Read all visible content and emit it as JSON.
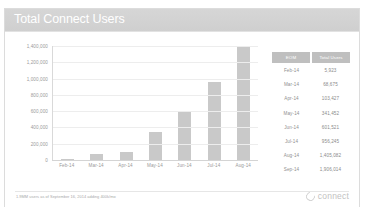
{
  "top_strip": {
    "text": ""
  },
  "card": {
    "title": "Total Connect Users"
  },
  "chart_data": {
    "type": "bar",
    "title": "Total Connect Users",
    "xlabel": "",
    "ylabel": "",
    "ylim": [
      0,
      1400000
    ],
    "grid": true,
    "legend": "none",
    "categories": [
      "Feb-14",
      "Mar-14",
      "Apr-14",
      "May-14",
      "Jun-14",
      "Jul-14",
      "Aug-14"
    ],
    "values": [
      5923,
      68675,
      103427,
      341452,
      601521,
      956245,
      1405082
    ],
    "ytick_labels": [
      "1,400,000",
      "1,200,000",
      "1,000,000",
      "800,000",
      "600,000",
      "400,000",
      "200,000",
      "0"
    ],
    "ytick_values": [
      1400000,
      1200000,
      1000000,
      800000,
      600000,
      400000,
      200000,
      0
    ],
    "bar_color": "#c9c9c9"
  },
  "table": {
    "headers": [
      "EOM",
      "Total Users"
    ],
    "rows": [
      {
        "eom": "Feb-14",
        "users": "5,923"
      },
      {
        "eom": "Mar-14",
        "users": "68,675"
      },
      {
        "eom": "Apr-14",
        "users": "103,427"
      },
      {
        "eom": "May-14",
        "users": "341,452"
      },
      {
        "eom": "Jun-14",
        "users": "601,521"
      },
      {
        "eom": "Jul-14",
        "users": "956,245"
      },
      {
        "eom": "Aug-14",
        "users": "1,405,082"
      },
      {
        "eom": "Sep-14",
        "users": "1,906,014"
      }
    ]
  },
  "footer": {
    "note": "1.9MM users as of September 16, 2014 adding 400k/mo",
    "brand": "connect"
  },
  "colors": {
    "header_bar": "#d2d2d2",
    "bar": "#c9c9c9",
    "table_header": "#bfbfbf",
    "text_muted": "#9a9a9a"
  }
}
